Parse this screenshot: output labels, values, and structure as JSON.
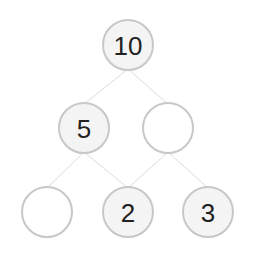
{
  "diagram": {
    "colors": {
      "stroke": "#c8c8c8",
      "edge": "#dcdcdc",
      "filled": "#f4f4f4",
      "empty": "#ffffff",
      "text": "#222222"
    },
    "nodes": [
      {
        "id": "n0",
        "label": "10",
        "cx": 128,
        "cy": 45,
        "filled": true
      },
      {
        "id": "n1",
        "label": "5",
        "cx": 84,
        "cy": 128,
        "filled": true
      },
      {
        "id": "n2",
        "label": "",
        "cx": 168,
        "cy": 128,
        "filled": false
      },
      {
        "id": "n3",
        "label": "",
        "cx": 47,
        "cy": 212,
        "filled": false
      },
      {
        "id": "n4",
        "label": "2",
        "cx": 128,
        "cy": 212,
        "filled": true
      },
      {
        "id": "n5",
        "label": "3",
        "cx": 208,
        "cy": 212,
        "filled": true
      }
    ],
    "edges": [
      [
        "n0",
        "n1"
      ],
      [
        "n0",
        "n2"
      ],
      [
        "n1",
        "n3"
      ],
      [
        "n1",
        "n4"
      ],
      [
        "n2",
        "n4"
      ],
      [
        "n2",
        "n5"
      ]
    ]
  }
}
